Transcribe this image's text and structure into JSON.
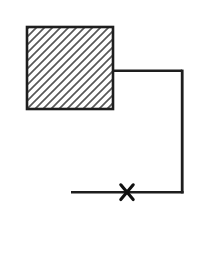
{
  "figure": {
    "width": 202,
    "height": 263,
    "background": "#ffffff",
    "stroke_color": "#1e1e1e",
    "hatch_color": "#575757",
    "hatched_block": {
      "x": 27,
      "y": 27,
      "width": 86,
      "height": 82,
      "border_width": 2.6,
      "hatch_direction": "forward-diagonal",
      "hatch_spacing": 8,
      "hatch_stroke_width": 1.7
    },
    "top_line": {
      "x1": 112,
      "y1": 70.8,
      "x2": 182.2,
      "y2": 70.8,
      "stroke_width": 2.6
    },
    "right_line": {
      "x1": 182.2,
      "y1": 69.6,
      "x2": 182.2,
      "y2": 193.4,
      "stroke_width": 2.8
    },
    "bottom_line": {
      "x1": 71,
      "y1": 192.2,
      "x2": 183.6,
      "y2": 192.2,
      "stroke_width": 2.6
    },
    "x_marker": {
      "cx": 127,
      "cy": 192.2,
      "half_width": 6.2,
      "half_height": 7.4,
      "stroke_width": 3.1,
      "color": "#111111"
    }
  }
}
